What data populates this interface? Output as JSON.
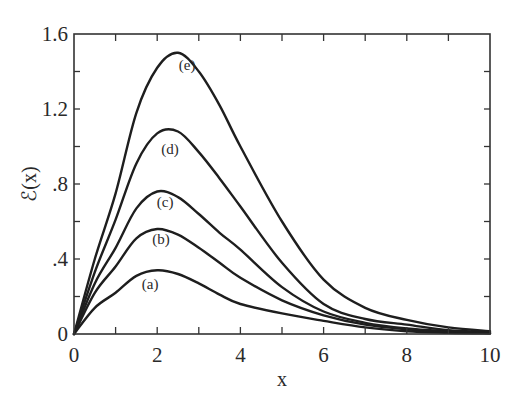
{
  "chart_data": {
    "type": "line",
    "title": "",
    "xlabel": "x",
    "ylabel": "ℰ(x)",
    "xlim": [
      0,
      10
    ],
    "ylim": [
      0,
      1.6
    ],
    "grid": false,
    "legend": "inline curve labels",
    "x_ticks": [
      0,
      2,
      4,
      6,
      8,
      10
    ],
    "x_tick_labels": [
      "0",
      "2",
      "4",
      "6",
      "8",
      "10"
    ],
    "x_minor_ticks": [
      1,
      3,
      5,
      7,
      9
    ],
    "y_ticks": [
      0,
      0.4,
      0.8,
      1.2,
      1.6
    ],
    "y_tick_labels": [
      "0",
      ".4",
      ".8",
      "1.2",
      "1.6"
    ],
    "y_minor_ticks": [
      0.2,
      0.6,
      1.0,
      1.4
    ],
    "x": [
      0,
      0.5,
      1,
      1.5,
      2,
      2.5,
      3,
      3.5,
      4,
      5,
      6,
      7,
      8,
      9,
      10
    ],
    "series": [
      {
        "name": "(a)",
        "label_pos": [
          1.83,
          0.24
        ],
        "values": [
          0,
          0.14,
          0.22,
          0.31,
          0.34,
          0.32,
          0.27,
          0.21,
          0.16,
          0.11,
          0.07,
          0.035,
          0.015,
          0.007,
          0.003
        ]
      },
      {
        "name": "(b)",
        "label_pos": [
          2.09,
          0.48
        ],
        "values": [
          0,
          0.22,
          0.36,
          0.51,
          0.56,
          0.53,
          0.46,
          0.38,
          0.3,
          0.18,
          0.1,
          0.05,
          0.025,
          0.01,
          0.005
        ]
      },
      {
        "name": "(c)",
        "label_pos": [
          2.19,
          0.68
        ],
        "values": [
          0,
          0.27,
          0.46,
          0.67,
          0.76,
          0.73,
          0.64,
          0.54,
          0.45,
          0.25,
          0.12,
          0.06,
          0.03,
          0.015,
          0.005
        ]
      },
      {
        "name": "(d)",
        "label_pos": [
          2.31,
          0.96
        ],
        "values": [
          0,
          0.33,
          0.61,
          0.91,
          1.07,
          1.08,
          0.97,
          0.83,
          0.68,
          0.38,
          0.16,
          0.08,
          0.05,
          0.02,
          0.01
        ]
      },
      {
        "name": "(e)",
        "label_pos": [
          2.72,
          1.41
        ],
        "values": [
          0,
          0.4,
          0.75,
          1.18,
          1.42,
          1.5,
          1.4,
          1.22,
          1.0,
          0.6,
          0.29,
          0.14,
          0.075,
          0.035,
          0.015
        ]
      }
    ]
  },
  "plot_area": {
    "left": 74,
    "right": 490,
    "top": 34,
    "bottom": 334
  },
  "colors": {
    "curve": "#1e1e1e",
    "axis": "#333333",
    "background": "#ffffff"
  }
}
